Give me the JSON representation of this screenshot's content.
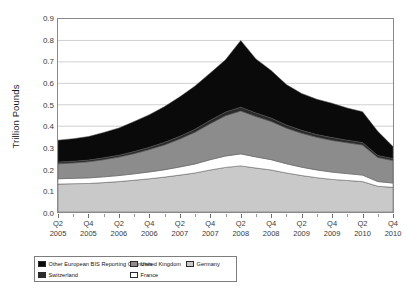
{
  "chart_data": {
    "type": "area",
    "stacked": true,
    "title": "",
    "xlabel": "",
    "ylabel": "Trillion Pounds",
    "ylim": [
      0.0,
      0.9
    ],
    "yticks": [
      "0.0",
      "0.1",
      "0.2",
      "0.3",
      "0.4",
      "0.5",
      "0.6",
      "0.7",
      "0.8",
      "0.9"
    ],
    "grid": true,
    "legend_position": "bottom-left",
    "x": [
      "Q2 2005",
      "Q3 2005",
      "Q4 2005",
      "Q1 2006",
      "Q2 2006",
      "Q3 2006",
      "Q4 2006",
      "Q1 2007",
      "Q2 2007",
      "Q3 2007",
      "Q4 2007",
      "Q1 2008",
      "Q2 2008",
      "Q3 2008",
      "Q4 2008",
      "Q1 2009",
      "Q2 2009",
      "Q3 2009",
      "Q4 2009",
      "Q1 2010",
      "Q2 2010",
      "Q3 2010",
      "Q4 2010"
    ],
    "xtick_labels": [
      {
        "q": "Q2",
        "yr": "2005"
      },
      {
        "q": "Q4",
        "yr": "2005"
      },
      {
        "q": "Q2",
        "yr": "2006"
      },
      {
        "q": "Q4",
        "yr": "2006"
      },
      {
        "q": "Q2",
        "yr": "2007"
      },
      {
        "q": "Q4",
        "yr": "2007"
      },
      {
        "q": "Q2",
        "yr": "2008"
      },
      {
        "q": "Q4",
        "yr": "2008"
      },
      {
        "q": "Q2",
        "yr": "2009"
      },
      {
        "q": "Q4",
        "yr": "2009"
      },
      {
        "q": "Q2",
        "yr": "2010"
      },
      {
        "q": "Q4",
        "yr": "2010"
      }
    ],
    "series": [
      {
        "name": "Germany",
        "color": "#c9c9c9",
        "values": [
          0.13,
          0.132,
          0.133,
          0.137,
          0.142,
          0.148,
          0.155,
          0.163,
          0.172,
          0.182,
          0.196,
          0.208,
          0.215,
          0.205,
          0.196,
          0.182,
          0.17,
          0.16,
          0.152,
          0.147,
          0.142,
          0.12,
          0.115
        ]
      },
      {
        "name": "France",
        "color": "#ffffff",
        "values": [
          0.025,
          0.025,
          0.026,
          0.027,
          0.028,
          0.03,
          0.032,
          0.034,
          0.038,
          0.042,
          0.048,
          0.053,
          0.056,
          0.052,
          0.048,
          0.043,
          0.039,
          0.036,
          0.034,
          0.032,
          0.03,
          0.022,
          0.02
        ]
      },
      {
        "name": "United Kingdom",
        "color": "#8c8c8c",
        "values": [
          0.07,
          0.072,
          0.075,
          0.08,
          0.086,
          0.094,
          0.104,
          0.116,
          0.13,
          0.148,
          0.168,
          0.188,
          0.2,
          0.188,
          0.178,
          0.166,
          0.158,
          0.152,
          0.148,
          0.144,
          0.14,
          0.112,
          0.105
        ]
      },
      {
        "name": "Switzerland",
        "color": "#2a2a2a",
        "values": [
          0.008,
          0.008,
          0.008,
          0.009,
          0.009,
          0.01,
          0.011,
          0.012,
          0.013,
          0.014,
          0.016,
          0.017,
          0.018,
          0.017,
          0.016,
          0.015,
          0.014,
          0.013,
          0.013,
          0.012,
          0.012,
          0.01,
          0.009
        ]
      },
      {
        "name": "Other European BIS Reporting Countries",
        "color": "#0a0a0a",
        "values": [
          0.102,
          0.105,
          0.11,
          0.118,
          0.127,
          0.14,
          0.152,
          0.167,
          0.184,
          0.202,
          0.22,
          0.244,
          0.311,
          0.252,
          0.222,
          0.188,
          0.172,
          0.165,
          0.16,
          0.15,
          0.144,
          0.112,
          0.056
        ]
      }
    ],
    "totals": [
      0.335,
      0.342,
      0.352,
      0.371,
      0.392,
      0.422,
      0.454,
      0.492,
      0.537,
      0.588,
      0.648,
      0.71,
      0.8,
      0.714,
      0.66,
      0.594,
      0.553,
      0.526,
      0.507,
      0.485,
      0.468,
      0.376,
      0.305
    ]
  },
  "legend": {
    "rows": [
      [
        {
          "label": "Other European BIS Reporting Countries",
          "color": "#0a0a0a",
          "cls": "li-a"
        },
        {
          "label": "United Kingdom",
          "color": "#8c8c8c",
          "cls": "li-b"
        },
        {
          "label": "Germany",
          "color": "#c9c9c9",
          "cls": "li-c"
        }
      ],
      [
        {
          "label": "Switzerland",
          "color": "#2a2a2a",
          "cls": "li-a"
        },
        {
          "label": "France",
          "color": "#ffffff",
          "cls": "li-b"
        }
      ]
    ]
  }
}
